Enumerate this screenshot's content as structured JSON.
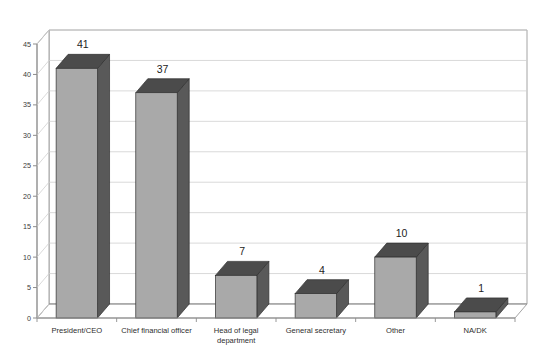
{
  "chart_data": {
    "type": "bar",
    "title": "",
    "subtitle": "",
    "xlabel": "",
    "ylabel": "",
    "categories": [
      "President/CEO",
      "Chief financial officer",
      "Head of legal\ndepartment",
      "General secretary",
      "Other",
      "NA/DK"
    ],
    "values": [
      41,
      37,
      7,
      4,
      10,
      1
    ],
    "data_labels": [
      "41",
      "37",
      "7",
      "4",
      "10",
      "1"
    ],
    "ylim": [
      0,
      45
    ],
    "ytick_values": [
      0,
      5,
      10,
      15,
      20,
      25,
      30,
      35,
      40,
      45
    ],
    "ytick_labels": [
      "0",
      "5",
      "10",
      "15",
      "20",
      "25",
      "30",
      "35",
      "40",
      "45"
    ],
    "grid": true,
    "grid_axis": "y",
    "legend": false,
    "legend_position": "none",
    "three_d": true,
    "orientation": "vertical"
  },
  "style": {
    "bar_front_color": "#a9a9a9",
    "bar_side_color": "#595959",
    "bar_top_color": "#4b4b4b",
    "bar_edge_color": "#2f2f2f",
    "grid_color": "#cfcfcf",
    "axis_color": "#8d8d8d",
    "frame_color": "#9a9a9a",
    "plot_background": "#ffffff",
    "text_color": "#2b2b2b"
  },
  "footer": {
    "source_note": ""
  }
}
